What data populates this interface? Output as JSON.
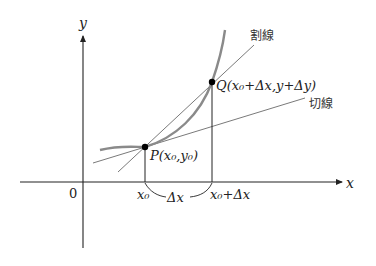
{
  "diagram": {
    "type": "derivative-secant-tangent",
    "axes": {
      "x_label": "x",
      "y_label": "y",
      "origin_label": "0"
    },
    "points": {
      "P": {
        "label": "P",
        "coords_text": "(x₀,y₀)"
      },
      "Q": {
        "label": "Q",
        "coords_text": "(x₀+Δx,y+Δy)"
      }
    },
    "tick_labels": {
      "x0": "x₀",
      "x0_plus_dx": "x₀+Δx",
      "delta_x": "Δx"
    },
    "line_labels": {
      "secant": "割線",
      "tangent": "切線"
    },
    "colors": {
      "axis": "#222222",
      "curve": "#8a8a8a",
      "lines": "#7a7a7a",
      "points": "#000000"
    }
  }
}
